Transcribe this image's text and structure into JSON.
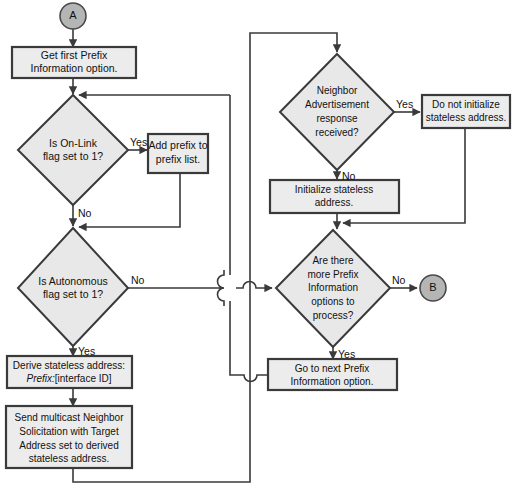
{
  "diagram": {
    "type": "flowchart",
    "colors": {
      "node_fill": "#e8e8e8",
      "node_stroke": "#3a3a3a",
      "terminator_fill": "#b5b5b5",
      "connector": "#3a3a3a",
      "background": "#ffffff"
    },
    "terminators": [
      {
        "id": "A",
        "label": "A",
        "shape": "circle"
      },
      {
        "id": "B",
        "label": "B",
        "shape": "circle"
      }
    ],
    "nodes": [
      {
        "id": "get-first-prefix",
        "shape": "process",
        "lines": [
          "Get first Prefix",
          "Information option."
        ]
      },
      {
        "id": "is-onlink",
        "shape": "decision",
        "lines": [
          "Is On-Link",
          "flag set to 1?"
        ]
      },
      {
        "id": "add-prefix",
        "shape": "process",
        "lines": [
          "Add prefix to",
          "prefix list."
        ]
      },
      {
        "id": "is-autonomous",
        "shape": "decision",
        "lines": [
          "Is Autonomous",
          "flag set to 1?"
        ]
      },
      {
        "id": "derive-stateless",
        "shape": "process",
        "lines": [
          "Derive stateless address:",
          "Prefix:[interface ID]"
        ],
        "italic_prefix": "Prefix:",
        "italic_rest": "[interface ID]"
      },
      {
        "id": "send-multicast-ns",
        "shape": "process",
        "lines": [
          "Send multicast Neighbor",
          "Solicitation with Target",
          "Address set to derived",
          "stateless address."
        ]
      },
      {
        "id": "na-received",
        "shape": "decision",
        "lines": [
          "Neighbor",
          "Advertisement",
          "response",
          "received?"
        ]
      },
      {
        "id": "do-not-initialize",
        "shape": "process",
        "lines": [
          "Do not initialize",
          "stateless address."
        ]
      },
      {
        "id": "initialize-stateless",
        "shape": "process",
        "lines": [
          "Initialize stateless",
          "address."
        ]
      },
      {
        "id": "more-prefix-options",
        "shape": "decision",
        "lines": [
          "Are there",
          "more Prefix",
          "Information",
          "options to",
          "process?"
        ]
      },
      {
        "id": "go-to-next-prefix",
        "shape": "process",
        "lines": [
          "Go to next Prefix",
          "Information option."
        ]
      }
    ],
    "edge_labels": {
      "onlink_yes": "Yes",
      "onlink_no": "No",
      "autonomous_no": "No",
      "autonomous_yes": "Yes",
      "na_yes": "Yes",
      "na_no": "No",
      "more_no": "No",
      "more_yes": "Yes"
    }
  }
}
